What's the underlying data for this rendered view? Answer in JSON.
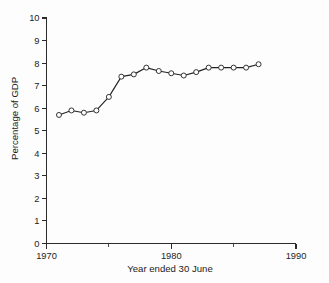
{
  "chart_data": {
    "type": "line",
    "title": "",
    "xlabel": "Year ended 30 June",
    "ylabel": "Percentage of GDP",
    "xlim": [
      1970,
      1990
    ],
    "ylim": [
      0,
      10
    ],
    "grid": false,
    "legend": null,
    "x_ticks": [
      1970,
      1980,
      1990
    ],
    "x_tick_labels": [
      "1970",
      "1980",
      "1990"
    ],
    "x_minor_ticks": [
      1975,
      1985
    ],
    "y_ticks": [
      0,
      1,
      2,
      3,
      4,
      5,
      6,
      7,
      8,
      9,
      10
    ],
    "y_tick_labels": [
      "0",
      "1",
      "2",
      "3",
      "4",
      "5",
      "6",
      "7",
      "8",
      "9",
      "10"
    ],
    "marker": "open-circle",
    "series": [
      {
        "name": "Percentage of GDP",
        "x": [
          1971,
          1972,
          1973,
          1974,
          1975,
          1976,
          1977,
          1978,
          1979,
          1980,
          1981,
          1982,
          1983,
          1984,
          1985,
          1986,
          1987
        ],
        "values": [
          5.7,
          5.9,
          5.8,
          5.9,
          6.5,
          7.4,
          7.5,
          7.8,
          7.65,
          7.55,
          7.45,
          7.6,
          7.8,
          7.8,
          7.8,
          7.8,
          7.95
        ]
      }
    ]
  },
  "axes": {
    "y_axis_title": "Percentage of GDP",
    "x_axis_title": "Year ended 30 June"
  }
}
